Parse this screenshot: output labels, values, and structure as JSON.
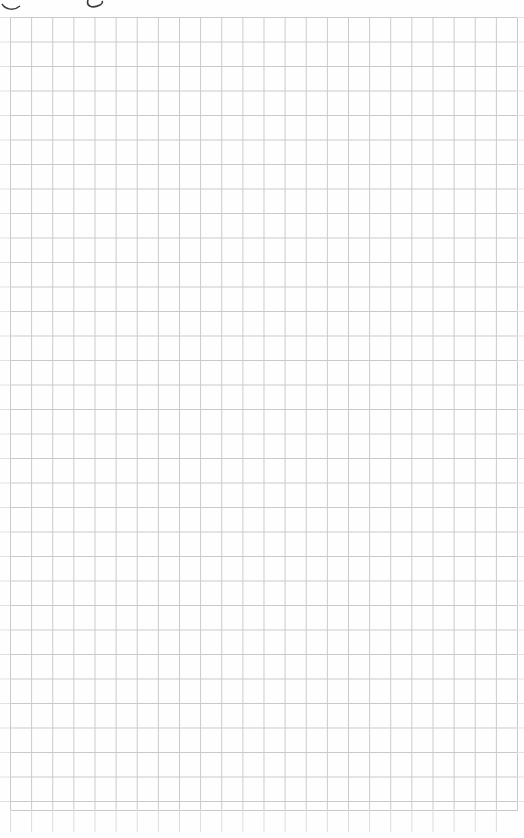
{
  "page": {
    "type": "graph-paper",
    "background_color": "#fefefe",
    "grid_line_color": "#c9c9c9",
    "columns": 24,
    "rows": 32
  },
  "header": {
    "handwriting_fragments": [
      "",
      ""
    ]
  }
}
